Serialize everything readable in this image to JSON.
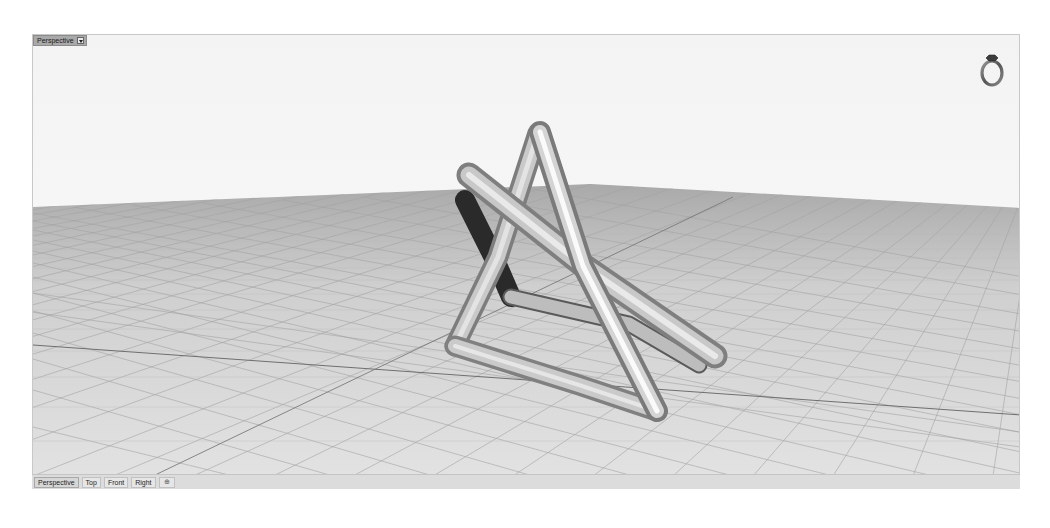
{
  "viewport": {
    "title": "Perspective",
    "menu_icon": "dropdown-arrow-icon",
    "navigation_widget": "ring-navigation-icon",
    "background_top": "#f5f5f5",
    "grid_color": "#bdbdbd",
    "major_grid_color": "#7d7d7d",
    "ground_color": "#d8d8d8"
  },
  "tabs": [
    {
      "label": "Perspective",
      "active": true
    },
    {
      "label": "Top",
      "active": false
    },
    {
      "label": "Front",
      "active": false
    },
    {
      "label": "Right",
      "active": false
    }
  ],
  "add_tab": {
    "label": "⊕",
    "icon": "add-viewport-icon"
  },
  "model": {
    "description": "Tubular twisted triangular frame object rendered in shaded mode",
    "color": "#c4c4c4"
  }
}
